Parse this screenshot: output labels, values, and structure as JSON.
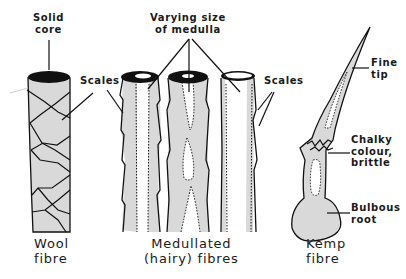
{
  "diagram": {
    "colors": {
      "ink": "#111111",
      "fill": "#d9d9d9",
      "background": "#ffffff"
    },
    "fibres": [
      {
        "id": "wool",
        "name_line1": "Wool",
        "name_line2": "fibre",
        "annotations": [
          {
            "line1": "Solid",
            "line2": "core"
          },
          {
            "line1": "Scales"
          }
        ]
      },
      {
        "id": "medullated",
        "name_line1": "Medullated",
        "name_line2": "(hairy)  fibres",
        "annotations": [
          {
            "line1": "Varying  size",
            "line2": "of medulla"
          },
          {
            "line1": "Scales"
          }
        ]
      },
      {
        "id": "kemp",
        "name_line1": "Kemp",
        "name_line2": "fibre",
        "annotations": [
          {
            "line1": "Fine",
            "line2": "tip"
          },
          {
            "line1": "Chalky",
            "line2": "colour,",
            "line3": "brittle"
          },
          {
            "line1": "Bulbous",
            "line2": "root"
          }
        ]
      }
    ]
  }
}
